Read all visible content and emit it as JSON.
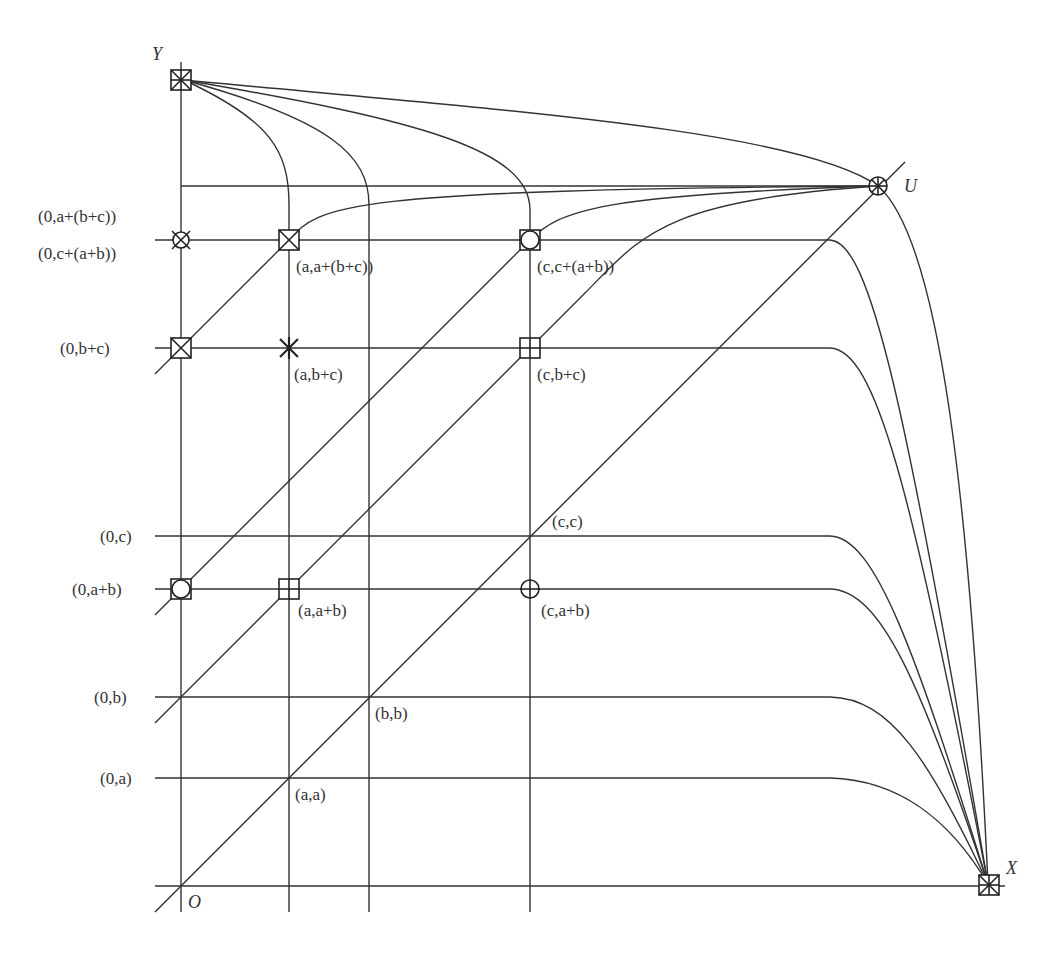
{
  "diagram": {
    "axes": {
      "origin_label": "O",
      "x_label": "X",
      "y_label": "Y",
      "u_label": "U"
    },
    "y_labels": [
      {
        "key": "a_bc",
        "text": "(0,a+(b+c))",
        "y": 240
      },
      {
        "key": "c_ab",
        "text": "(0,c+(a+b))",
        "y": 262
      },
      {
        "key": "bc",
        "text": "(0,b+c)",
        "y": 348
      },
      {
        "key": "c",
        "text": "(0,c)",
        "y": 536
      },
      {
        "key": "ab",
        "text": "(0,a+b)",
        "y": 589
      },
      {
        "key": "b",
        "text": "(0,b)",
        "y": 697
      },
      {
        "key": "a",
        "text": "(0,a)",
        "y": 778
      }
    ],
    "point_labels": [
      {
        "key": "a_a_bc",
        "text": "(a,a+(b+c))"
      },
      {
        "key": "c_c_ab",
        "text": "(c,c+(a+b))"
      },
      {
        "key": "a_bc",
        "text": "(a,b+c)"
      },
      {
        "key": "c_bc",
        "text": "(c,b+c)"
      },
      {
        "key": "c_c",
        "text": "(c,c)"
      },
      {
        "key": "a_ab",
        "text": "(a,a+b)"
      },
      {
        "key": "c_ab",
        "text": "(c,a+b)"
      },
      {
        "key": "b_b",
        "text": "(b,b)"
      },
      {
        "key": "a_a",
        "text": "(a,a)"
      }
    ],
    "markers": [
      {
        "name": "Y",
        "shape": "boxed-asterisk"
      },
      {
        "name": "X",
        "shape": "boxed-asterisk"
      },
      {
        "name": "U",
        "shape": "circled-asterisk"
      },
      {
        "name": "(0,a+(b+c))",
        "shape": "circled-cross"
      },
      {
        "name": "(a,a+(b+c))",
        "shape": "boxed-cross"
      },
      {
        "name": "(c,c+(a+b))",
        "shape": "boxed-circle"
      },
      {
        "name": "(0,b+c)",
        "shape": "boxed-cross"
      },
      {
        "name": "(a,b+c)",
        "shape": "asterisk"
      },
      {
        "name": "(c,b+c)",
        "shape": "boxed-plus"
      },
      {
        "name": "(0,a+b)",
        "shape": "boxed-circle"
      },
      {
        "name": "(a,a+b)",
        "shape": "boxed-plus"
      },
      {
        "name": "(c,a+b)",
        "shape": "circled-plus"
      }
    ],
    "grid": {
      "x_lines": {
        "O": 181,
        "a": 289,
        "b": 369,
        "c": 530
      },
      "y_lines": {
        "X_axis": 886,
        "a": 778,
        "b": 697,
        "ab": 589,
        "c": 536,
        "bc": 348,
        "a_bc": 240,
        "Y": 80
      }
    },
    "colors": {
      "line": "#333333",
      "background": "#ffffff"
    }
  }
}
